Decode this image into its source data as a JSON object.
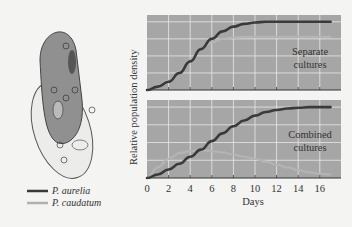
{
  "figure": {
    "ylabel": "Relative population density",
    "xlabel": "Days",
    "x_ticks": [
      "0",
      "2",
      "4",
      "6",
      "8",
      "10",
      "12",
      "14",
      "16"
    ],
    "panels": [
      {
        "label_line1": "Separate",
        "label_line2": "cultures"
      },
      {
        "label_line1": "Combined",
        "label_line2": "cultures"
      }
    ],
    "legend": [
      {
        "name": "P. aurelia",
        "color": "#3a3a3a"
      },
      {
        "name": "P. caudatum",
        "color": "#a8a8a8"
      }
    ],
    "colors": {
      "panel_bg": "#a6a6a6",
      "grid": "#e8e8e8",
      "aurelia": "#3a3a3a",
      "caudatum": "#b4b4b4"
    }
  },
  "chart_data": [
    {
      "type": "line",
      "title": "Separate cultures",
      "xlabel": "Days",
      "ylabel": "Relative population density",
      "x": [
        0,
        1,
        2,
        3,
        4,
        5,
        6,
        7,
        8,
        9,
        10,
        11,
        12,
        13,
        14,
        15,
        16,
        17
      ],
      "series": [
        {
          "name": "P. aurelia",
          "values": [
            0,
            0.05,
            0.12,
            0.25,
            0.42,
            0.6,
            0.75,
            0.86,
            0.93,
            0.97,
            0.99,
            1.0,
            1.0,
            1.0,
            1.0,
            1.0,
            1.0,
            1.0
          ]
        },
        {
          "name": "P. caudatum",
          "values": [
            0,
            0.06,
            0.14,
            0.27,
            0.44,
            0.6,
            0.7,
            0.75,
            0.77,
            0.78,
            0.78,
            0.78,
            0.78,
            0.78,
            0.78,
            0.78,
            0.78,
            0.78
          ]
        }
      ],
      "xlim": [
        0,
        17
      ],
      "ylim": [
        0,
        1.1
      ],
      "grid": true
    },
    {
      "type": "line",
      "title": "Combined cultures",
      "xlabel": "Days",
      "ylabel": "Relative population density",
      "x": [
        0,
        1,
        2,
        3,
        4,
        5,
        6,
        7,
        8,
        9,
        10,
        11,
        12,
        13,
        14,
        15,
        16,
        17
      ],
      "series": [
        {
          "name": "P. aurelia",
          "values": [
            0,
            0.05,
            0.12,
            0.2,
            0.3,
            0.4,
            0.52,
            0.63,
            0.73,
            0.81,
            0.88,
            0.93,
            0.96,
            0.98,
            0.99,
            1.0,
            1.0,
            1.0
          ]
        },
        {
          "name": "P. caudatum",
          "values": [
            0,
            0.15,
            0.27,
            0.35,
            0.38,
            0.39,
            0.38,
            0.36,
            0.33,
            0.3,
            0.27,
            0.23,
            0.19,
            0.15,
            0.11,
            0.08,
            0.06,
            0.05
          ]
        }
      ],
      "xlim": [
        0,
        17
      ],
      "ylim": [
        0,
        1.1
      ],
      "grid": true
    }
  ]
}
